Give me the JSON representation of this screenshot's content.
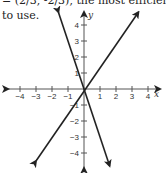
{
  "text": {
    "top_line": "= (2/3, -2/3), the most efficient",
    "body_line": "to use."
  },
  "chart_data": {
    "type": "line",
    "title": "",
    "xlabel": "x",
    "ylabel": "y",
    "xlim": [
      -4.5,
      4.5
    ],
    "ylim": [
      -4.5,
      4.5
    ],
    "x_ticks": [
      -4,
      -3,
      -2,
      -1,
      1,
      2,
      3,
      4
    ],
    "y_ticks": [
      -4,
      -3,
      -2,
      -1,
      1,
      2,
      3,
      4
    ],
    "x_tick_labels": [
      "−4",
      "−3",
      "−2",
      "−1",
      "1",
      "2",
      "3",
      "4"
    ],
    "y_tick_labels": [
      "4",
      "3",
      "2",
      "1",
      "−1",
      "−2",
      "−3",
      "−4"
    ],
    "grid": false,
    "series": [
      {
        "name": "line-1",
        "x": [
          -1.6,
          1.6
        ],
        "y": [
          4.8,
          -4.8
        ]
      },
      {
        "name": "line-2",
        "x": [
          -3.0,
          3.4
        ],
        "y": [
          -4.5,
          4.8
        ]
      }
    ],
    "intersection": [
      0.67,
      -0.67
    ]
  }
}
